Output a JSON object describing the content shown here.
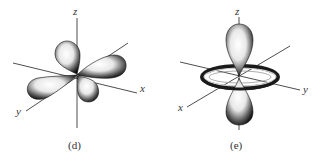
{
  "figures": [
    {
      "id": "d",
      "caption": "(d)",
      "description": "d orbital with four lobes lying between the x and y axes",
      "axes": {
        "z": "z",
        "x": "x",
        "y": "y"
      }
    },
    {
      "id": "e",
      "caption": "(e)",
      "description": "dz2 orbital with two lobes along z and a torus in the xy plane",
      "axes": {
        "z": "z",
        "x": "x",
        "y": "y"
      }
    }
  ],
  "colors": {
    "lobe_dark": "#1a1a1a",
    "lobe_light": "#f4f4f4",
    "axis": "#3a3a3a",
    "text": "#333333"
  }
}
